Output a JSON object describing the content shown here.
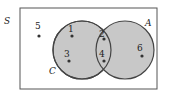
{
  "diagram": {
    "type": "venn",
    "universe_label": "S",
    "sets": [
      {
        "name": "C",
        "label": "C",
        "elements": [
          "1",
          "2",
          "3",
          "4"
        ]
      },
      {
        "name": "A",
        "label": "A",
        "elements": [
          "2",
          "4",
          "6"
        ]
      }
    ],
    "points": [
      {
        "label": "5",
        "region": "outside"
      },
      {
        "label": "1",
        "region": "C only"
      },
      {
        "label": "3",
        "region": "C only"
      },
      {
        "label": "2",
        "region": "C and A"
      },
      {
        "label": "4",
        "region": "C and A"
      },
      {
        "label": "6",
        "region": "A only"
      }
    ],
    "colors": {
      "fill": "#c8c8c8",
      "stroke": "#444444",
      "border": "#555555"
    }
  }
}
